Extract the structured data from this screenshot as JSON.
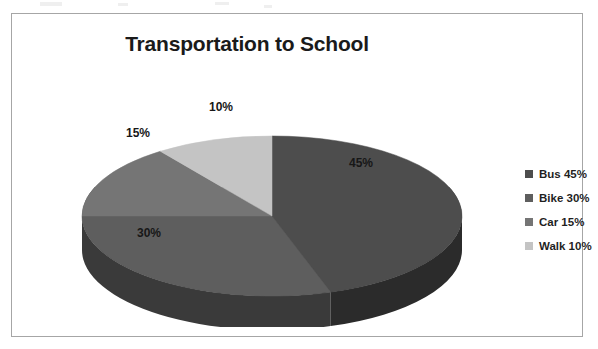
{
  "page": {
    "background_color": "#ffffff",
    "frame_border_color": "#a6a6a6"
  },
  "chart_data": {
    "type": "pie",
    "title": "Transportation to School",
    "xlabel": "",
    "ylabel": "",
    "categories": [
      "Bus",
      "Bike",
      "Car",
      "Walk"
    ],
    "values": [
      45,
      30,
      15,
      10
    ],
    "data_labels": [
      "45%",
      "30%",
      "15%",
      "10%"
    ],
    "legend_entries": [
      "Bus 45%",
      "Bike 30%",
      "Car 15%",
      "Walk 10%"
    ],
    "legend_position": "right",
    "colors": [
      "#4d4d4d",
      "#5e5e5e",
      "#757575",
      "#c4c4c4"
    ],
    "side_colors": [
      "#2b2b2b",
      "#3a3a3a",
      "#4d4d4d",
      "#8f8f8f"
    ],
    "grid": false,
    "three_d": true,
    "start_angle_deg": 0,
    "units": "percent",
    "total": 100
  },
  "title": {
    "text": "Transportation to School"
  },
  "slices": [
    {
      "name": "Bus",
      "label": "45%",
      "value": 45,
      "color": "#4d4d4d",
      "side_color": "#2b2b2b"
    },
    {
      "name": "Bike",
      "label": "30%",
      "value": 30,
      "color": "#5e5e5e",
      "side_color": "#3a3a3a"
    },
    {
      "name": "Car",
      "label": "15%",
      "value": 15,
      "color": "#757575",
      "side_color": "#4d4d4d"
    },
    {
      "name": "Walk",
      "label": "10%",
      "value": 10,
      "color": "#c4c4c4",
      "side_color": "#8f8f8f"
    }
  ],
  "legend": {
    "items": [
      {
        "label": "Bus 45%",
        "color": "#4d4d4d"
      },
      {
        "label": "Bike 30%",
        "color": "#5e5e5e"
      },
      {
        "label": "Car 15%",
        "color": "#757575"
      },
      {
        "label": "Walk 10%",
        "color": "#c4c4c4"
      }
    ]
  }
}
